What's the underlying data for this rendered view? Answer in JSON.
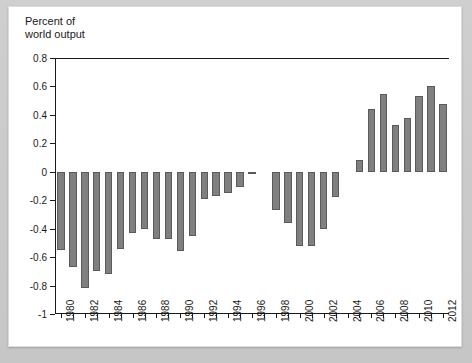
{
  "axis_title": "Percent of\nworld output",
  "chart_data": {
    "type": "bar",
    "title": "",
    "subtitle": "",
    "xlabel": "",
    "ylabel": "Percent of world output",
    "ylim": [
      -1,
      0.8
    ],
    "ytick_values": [
      0.8,
      0.6,
      0.4,
      0.2,
      0,
      -0.2,
      -0.4,
      -0.6,
      -0.8,
      -1
    ],
    "ytick_labels": [
      "0.8",
      "0.6",
      "0.4",
      "0.2",
      "0",
      "-0.2",
      "-0.4",
      "-0.6",
      "-0.8",
      "-1"
    ],
    "grid": false,
    "legend": "none",
    "bar_color": "#808080",
    "bar_edge_color": "#5a5a5a",
    "xtick_labels": [
      "1980",
      "1982",
      "1984",
      "1986",
      "1988",
      "1990",
      "1992",
      "1994",
      "1996",
      "1998",
      "2000",
      "2002",
      "2004",
      "2006",
      "2008",
      "2010",
      "2012"
    ],
    "xtick_label_interval": 2,
    "categories": [
      "1980",
      "1981",
      "1982",
      "1983",
      "1984",
      "1985",
      "1986",
      "1987",
      "1988",
      "1989",
      "1990",
      "1991",
      "1992",
      "1993",
      "1994",
      "1995",
      "1996",
      "1997",
      "1998",
      "1999",
      "2000",
      "2001",
      "2002",
      "2003",
      "2004",
      "2005",
      "2006",
      "2007",
      "2008",
      "2009",
      "2010",
      "2011",
      "2012"
    ],
    "values": [
      -0.55,
      -0.67,
      -0.82,
      -0.7,
      -0.72,
      -0.54,
      -0.43,
      -0.4,
      -0.47,
      -0.47,
      -0.56,
      -0.45,
      -0.19,
      -0.17,
      -0.15,
      -0.11,
      -0.01,
      0.0,
      -0.27,
      -0.36,
      -0.52,
      -0.52,
      -0.4,
      -0.18,
      0.0,
      0.08,
      0.44,
      0.55,
      0.33,
      0.38,
      0.53,
      0.6,
      0.48
    ]
  }
}
